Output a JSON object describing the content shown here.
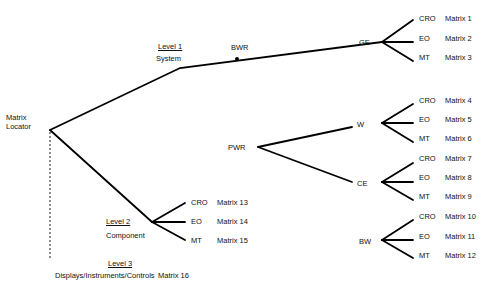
{
  "root": {
    "line1": "Matrix",
    "line2": "Locator"
  },
  "levels": {
    "level1": {
      "title": "Level 1",
      "name": "System"
    },
    "level2": {
      "title": "Level 2",
      "name": "Component"
    },
    "level3": {
      "title": "Level 3",
      "name": "Displays/Instruments/Controls",
      "matrix": "Matrix 16"
    }
  },
  "reactor_types": {
    "bwr": "BWR",
    "pwr": "PWR"
  },
  "vendors": [
    {
      "id": "ge",
      "label": "GE",
      "leaves": [
        {
          "type": "CRO",
          "matrix": "Matrix 1"
        },
        {
          "type": "EO",
          "matrix": "Matrix 2"
        },
        {
          "type": "MT",
          "matrix": "Matrix 3"
        }
      ]
    },
    {
      "id": "w",
      "label": "W",
      "leaves": [
        {
          "type": "CRO",
          "matrix": "Matrix 4"
        },
        {
          "type": "EO",
          "matrix": "Matrix 5"
        },
        {
          "type": "MT",
          "matrix": "Matrix 6"
        }
      ]
    },
    {
      "id": "ce",
      "label": "CE",
      "leaves": [
        {
          "type": "CRO",
          "matrix": "Matrix 7"
        },
        {
          "type": "EO",
          "matrix": "Matrix 8"
        },
        {
          "type": "MT",
          "matrix": "Matrix 9"
        }
      ]
    },
    {
      "id": "bw",
      "label": "BW",
      "leaves": [
        {
          "type": "CRO",
          "matrix": "Matrix 10"
        },
        {
          "type": "EO",
          "matrix": "Matrix 11"
        },
        {
          "type": "MT",
          "matrix": "Matrix 12"
        }
      ]
    }
  ],
  "component_leaves": [
    {
      "type": "CRO",
      "matrix": "Matrix 13"
    },
    {
      "type": "EO",
      "matrix": "Matrix 14"
    },
    {
      "type": "MT",
      "matrix": "Matrix 15"
    }
  ]
}
